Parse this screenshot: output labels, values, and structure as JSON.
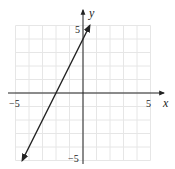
{
  "chart_data": {
    "type": "line",
    "title": "",
    "xlabel": "x",
    "ylabel": "y",
    "xlim": [
      -5,
      5
    ],
    "ylim": [
      -5,
      5
    ],
    "grid": true,
    "x_ticks": [
      "-5",
      "5"
    ],
    "y_ticks": [
      "5",
      "-5"
    ],
    "series": [
      {
        "name": "y = 2x + 4",
        "equation": "y = 2x + 4",
        "points": [
          [
            -4.5,
            -5
          ],
          [
            -2,
            0
          ],
          [
            0,
            4
          ],
          [
            0.5,
            5
          ]
        ],
        "arrows": "both"
      }
    ],
    "colors": {
      "grid": "#e6e6e6",
      "axis": "#222222",
      "line": "#222222"
    }
  },
  "labels": {
    "x_axis": "x",
    "y_axis": "y",
    "x_min_tick": "−5",
    "x_max_tick": "5",
    "y_max_tick": "5",
    "y_min_tick": "−5"
  }
}
